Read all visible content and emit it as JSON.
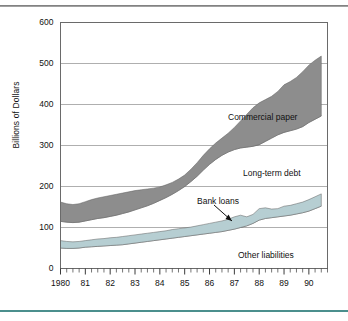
{
  "figure": {
    "background_color": "#ffffff",
    "top_rule_color": "#6f6f6f",
    "bottom_rule_color": "#4b8f8d"
  },
  "chart_data": {
    "type": "area",
    "title": "",
    "subtitle": "",
    "xlabel": "",
    "ylabel": "Billions of Dollars",
    "ylim": [
      0,
      600
    ],
    "yticks": [
      0,
      100,
      200,
      300,
      400,
      500,
      600
    ],
    "ytick_labels": [
      "0",
      "100",
      "200",
      "300",
      "400",
      "500",
      "600"
    ],
    "xlim": [
      1980,
      1990.75
    ],
    "xticks": [
      1980,
      1981,
      1982,
      1983,
      1984,
      1985,
      1986,
      1987,
      1988,
      1989,
      1990
    ],
    "xtick_labels": [
      "1980",
      "81",
      "82",
      "83",
      "84",
      "85",
      "86",
      "87",
      "88",
      "89",
      "90"
    ],
    "minor_tick_interval": 0.25,
    "grid": true,
    "grid_axis": "y",
    "grid_color": "#9b9b9b",
    "legend": "inline-annotations",
    "stacked": true,
    "stack_order_bottom_to_top": [
      "Other liabilities",
      "Bank loans",
      "Long-term debt",
      "Commercial paper"
    ],
    "x": [
      1980.0,
      1980.25,
      1980.5,
      1980.75,
      1981.0,
      1981.25,
      1981.5,
      1981.75,
      1982.0,
      1982.25,
      1982.5,
      1982.75,
      1983.0,
      1983.25,
      1983.5,
      1983.75,
      1984.0,
      1984.25,
      1984.5,
      1984.75,
      1985.0,
      1985.25,
      1985.5,
      1985.75,
      1986.0,
      1986.25,
      1986.5,
      1986.75,
      1987.0,
      1987.25,
      1987.5,
      1987.75,
      1988.0,
      1988.25,
      1988.5,
      1988.75,
      1989.0,
      1989.25,
      1989.5,
      1989.75,
      1990.0,
      1990.25,
      1990.5
    ],
    "series": [
      {
        "name": "Other liabilities",
        "fill": "none",
        "fill_color": "#ffffff",
        "cumulative_top_values": [
          50,
          49,
          49,
          50,
          52,
          53,
          54,
          55,
          56,
          57,
          58,
          60,
          62,
          64,
          66,
          68,
          70,
          72,
          74,
          76,
          78,
          80,
          82,
          84,
          86,
          88,
          90,
          93,
          96,
          100,
          104,
          110,
          118,
          122,
          124,
          126,
          128,
          130,
          133,
          136,
          140,
          146,
          152
        ]
      },
      {
        "name": "Bank loans",
        "fill": "solid",
        "fill_color": "#b6ced2",
        "cumulative_top_values": [
          68,
          66,
          65,
          66,
          68,
          70,
          72,
          73,
          75,
          76,
          78,
          80,
          82,
          84,
          86,
          88,
          90,
          92,
          95,
          97,
          99,
          101,
          104,
          107,
          110,
          113,
          116,
          120,
          126,
          130,
          126,
          132,
          146,
          148,
          145,
          146,
          152,
          154,
          158,
          162,
          168,
          175,
          182
        ]
      },
      {
        "name": "Long-term debt",
        "fill": "none",
        "fill_color": "#ffffff",
        "cumulative_top_values": [
          115,
          113,
          112,
          113,
          116,
          119,
          122,
          124,
          127,
          130,
          134,
          138,
          143,
          148,
          153,
          159,
          166,
          173,
          181,
          190,
          200,
          212,
          225,
          240,
          254,
          266,
          276,
          284,
          290,
          294,
          296,
          298,
          302,
          310,
          318,
          326,
          332,
          336,
          340,
          346,
          356,
          364,
          372
        ]
      },
      {
        "name": "Commercial paper",
        "fill": "solid",
        "fill_color": "#8d8d8d",
        "cumulative_top_values": [
          162,
          158,
          156,
          158,
          163,
          168,
          172,
          175,
          178,
          181,
          184,
          187,
          190,
          192,
          194,
          196,
          199,
          204,
          210,
          218,
          228,
          242,
          258,
          276,
          292,
          306,
          318,
          330,
          344,
          360,
          376,
          392,
          404,
          412,
          420,
          432,
          448,
          456,
          466,
          480,
          496,
          508,
          518
        ]
      }
    ],
    "annotations": [
      {
        "label": "Commercial paper",
        "target": "Commercial paper band"
      },
      {
        "label": "Long-term debt",
        "target": "Long-term debt region"
      },
      {
        "label": "Bank loans",
        "target": "Bank loans band",
        "has_arrow": true
      },
      {
        "label": "Other liabilities",
        "target": "Other liabilities region"
      }
    ]
  }
}
